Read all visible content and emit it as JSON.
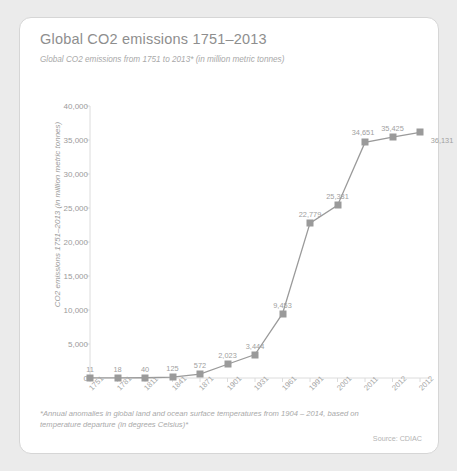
{
  "card": {
    "title": "Global CO2 emissions 1751–2013",
    "subtitle": "Global CO2 emissions from 1751 to 2013* (in million metric tonnes)",
    "footnote": "*Annual anomalies in global land and ocean surface temperatures from 1904 – 2014, based on temperature departure (in degrees Celsius)*",
    "source": "Source: CDIAC",
    "accent_color": "#9a9a9a",
    "text_color": "#9b9b9b"
  },
  "chart_data": {
    "type": "line",
    "title": "Global CO2 emissions 1751–2013",
    "subtitle": "Global CO2 emissions from 1751 to 2013* (in million metric tonnes)",
    "xlabel": "",
    "ylabel": "CO2 emissions 1751–2013 (in million metric tonnes)",
    "categories": [
      "1751",
      "1781",
      "1811",
      "1841",
      "1871",
      "1901",
      "1931",
      "1961",
      "1991",
      "2001",
      "2011",
      "2012",
      "2012"
    ],
    "values": [
      11,
      18,
      40,
      125,
      572,
      2023,
      3444,
      9453,
      22779,
      25381,
      34651,
      35425,
      36131
    ],
    "value_labels": [
      "11",
      "18",
      "40",
      "125",
      "572",
      "2,023",
      "3,444",
      "9,453",
      "22,779",
      "25,381",
      "34,651",
      "35,425",
      "36,131"
    ],
    "ylim": [
      0,
      40000
    ],
    "ytick_values": [
      0,
      5000,
      10000,
      15000,
      20000,
      25000,
      30000,
      35000,
      40000
    ],
    "ytick_labels": [
      "0",
      "5,000",
      "10,000",
      "15,000",
      "20,000",
      "25,000",
      "30,000",
      "35,000",
      "40,000"
    ],
    "grid": false,
    "legend": false,
    "series_color": "#9a9a9a",
    "marker": "square"
  }
}
